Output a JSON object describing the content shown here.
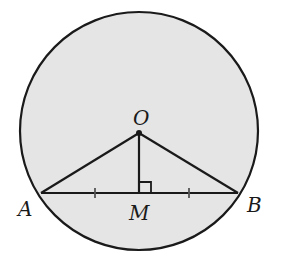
{
  "figure": {
    "type": "geometry",
    "colors": {
      "fill": "#e5e5e5",
      "stroke": "#1a1a1a",
      "tick": "#555555",
      "background": "#ffffff"
    },
    "circle": {
      "cx": 139,
      "cy": 131,
      "r": 119
    },
    "points": {
      "O": {
        "label": "O",
        "x": 139,
        "y": 133
      },
      "A": {
        "label": "A",
        "x": 41,
        "y": 193
      },
      "B": {
        "label": "B",
        "x": 238,
        "y": 193
      },
      "M": {
        "label": "M",
        "x": 139,
        "y": 193
      }
    },
    "segments": [
      "OA",
      "OB",
      "OM",
      "AB"
    ],
    "annotations": {
      "right_angle_at": "M",
      "equal_ticks": [
        "AM",
        "MB"
      ]
    }
  }
}
